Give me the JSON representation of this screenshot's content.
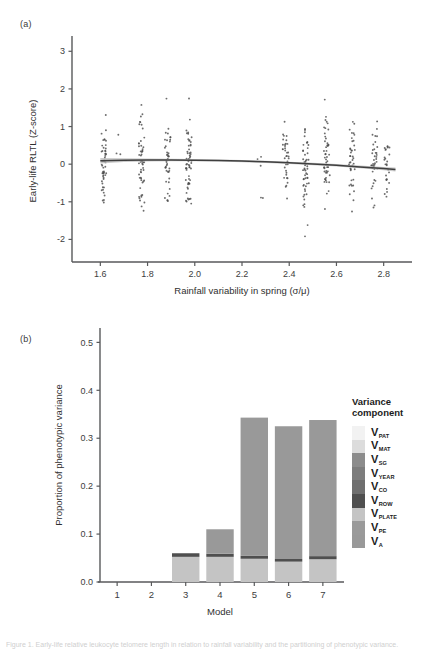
{
  "figure": {
    "panel_a_label": "(a)",
    "panel_b_label": "(b)",
    "caption": "Figure 1. Early-life relative leukocyte telomere length in relation to rainfall variability and the partitioning of phenotypic variance."
  },
  "chart_data": [
    {
      "id": "panel-a",
      "type": "scatter",
      "title": "",
      "xlabel": "Rainfall variability in spring (σ/μ)",
      "ylabel": "Early-life RLTL (Z-score)",
      "xlim": [
        1.48,
        2.92
      ],
      "ylim": [
        -2.6,
        3.3
      ],
      "xticks": [
        1.6,
        1.8,
        2.0,
        2.2,
        2.4,
        2.6,
        2.8
      ],
      "xtick_labels": [
        "1.6",
        "1.8",
        "2.0",
        "2.2",
        "2.4",
        "2.6",
        "2.8"
      ],
      "yticks": [
        -2,
        -1,
        0,
        1,
        2,
        3
      ],
      "ytick_labels": [
        "-2",
        "-1",
        "0",
        "1",
        "2",
        "3"
      ],
      "grid": false,
      "legend": "none",
      "point_color": "#4d4d4d",
      "fit_line_color": "#3f3f3f",
      "fit_ribbon_color": "#b9b9b9",
      "fit_curve": {
        "description": "Fitted quadratic trend, slightly declining with higher rainfall variability",
        "x": [
          1.6,
          1.7,
          1.8,
          1.9,
          2.0,
          2.1,
          2.2,
          2.3,
          2.4,
          2.5,
          2.6,
          2.7,
          2.8,
          2.85
        ],
        "y": [
          0.09,
          0.105,
          0.112,
          0.112,
          0.107,
          0.097,
          0.082,
          0.062,
          0.036,
          0.005,
          -0.031,
          -0.072,
          -0.118,
          -0.142
        ],
        "ribbon_halfwidth": [
          0.075,
          0.05,
          0.038,
          0.033,
          0.03,
          0.029,
          0.029,
          0.03,
          0.031,
          0.032,
          0.034,
          0.038,
          0.046,
          0.052
        ]
      },
      "point_clusters": [
        {
          "x": 1.615,
          "n": 52,
          "spread": 0.01,
          "y_mean": 0.05,
          "y_sd": 0.9
        },
        {
          "x": 1.68,
          "n": 3,
          "spread": 0.012,
          "y_mean": 0.1,
          "y_sd": 1.0
        },
        {
          "x": 1.775,
          "n": 54,
          "spread": 0.012,
          "y_mean": 0.02,
          "y_sd": 1.02
        },
        {
          "x": 1.885,
          "n": 42,
          "spread": 0.012,
          "y_mean": 0.12,
          "y_sd": 0.95
        },
        {
          "x": 1.975,
          "n": 58,
          "spread": 0.013,
          "y_mean": 0.08,
          "y_sd": 0.92
        },
        {
          "x": 2.275,
          "n": 5,
          "spread": 0.014,
          "y_mean": -0.6,
          "y_sd": 1.05
        },
        {
          "x": 2.385,
          "n": 36,
          "spread": 0.013,
          "y_mean": 0.1,
          "y_sd": 0.95
        },
        {
          "x": 2.47,
          "n": 52,
          "spread": 0.013,
          "y_mean": -0.25,
          "y_sd": 1.02
        },
        {
          "x": 2.56,
          "n": 50,
          "spread": 0.013,
          "y_mean": 0.25,
          "y_sd": 1.0
        },
        {
          "x": 2.665,
          "n": 40,
          "spread": 0.013,
          "y_mean": -0.05,
          "y_sd": 0.95
        },
        {
          "x": 2.76,
          "n": 38,
          "spread": 0.013,
          "y_mean": 0.05,
          "y_sd": 0.9
        },
        {
          "x": 2.815,
          "n": 26,
          "spread": 0.012,
          "y_mean": -0.1,
          "y_sd": 0.85
        }
      ]
    },
    {
      "id": "panel-b",
      "type": "bar",
      "stacked": true,
      "title": "",
      "xlabel": "Model",
      "ylabel": "Proportion of phenotypic variance",
      "categories": [
        "1",
        "2",
        "3",
        "4",
        "5",
        "6",
        "7"
      ],
      "ylim": [
        0.0,
        0.53
      ],
      "yticks": [
        0.0,
        0.1,
        0.2,
        0.3,
        0.4,
        0.5
      ],
      "ytick_labels": [
        "0.0",
        "0.1",
        "0.2",
        "0.3",
        "0.4",
        "0.5"
      ],
      "grid": false,
      "legend": "right",
      "series": [
        {
          "name": "V_PLATE",
          "label": "V",
          "sub": "PLATE",
          "color": "#c4c4c4",
          "values": [
            0.0,
            0.0,
            0.0525,
            0.0525,
            0.0485,
            0.0425,
            0.0475
          ]
        },
        {
          "name": "V_ROW",
          "label": "V",
          "sub": "ROW",
          "color": "#4f4f4f",
          "values": [
            0.0,
            0.0,
            0.0075,
            0.0065,
            0.006,
            0.0055,
            0.0065
          ]
        },
        {
          "name": "V_A",
          "label": "V",
          "sub": "A",
          "color": "#999999",
          "values": [
            0.0,
            0.0,
            0.0,
            0.051,
            0.2885,
            0.277,
            0.284
          ]
        }
      ],
      "bar_totals": [
        0.0,
        0.0,
        0.06,
        0.11,
        0.343,
        0.325,
        0.338
      ]
    }
  ],
  "legend": {
    "title_line1": "Variance",
    "title_line2": "component",
    "items": [
      {
        "label": "V",
        "sub": "PAT",
        "color": "#f2f2f2"
      },
      {
        "label": "V",
        "sub": "MAT",
        "color": "#dcdcdc"
      },
      {
        "label": "V",
        "sub": "SG",
        "color": "#8c8c8c"
      },
      {
        "label": "V",
        "sub": "YEAR",
        "color": "#7d7d7d"
      },
      {
        "label": "V",
        "sub": "CO",
        "color": "#6f6f6f"
      },
      {
        "label": "V",
        "sub": "ROW",
        "color": "#4f4f4f"
      },
      {
        "label": "V",
        "sub": "PLATE",
        "color": "#c4c4c4"
      },
      {
        "label": "V",
        "sub": "PE",
        "color": "#9a9a9a"
      },
      {
        "label": "V",
        "sub": "A",
        "color": "#999999"
      }
    ]
  }
}
